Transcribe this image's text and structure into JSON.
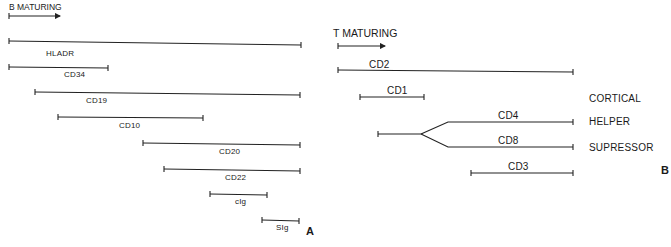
{
  "panel_a": {
    "letter": "A",
    "title": "B MATURING",
    "markers": [
      {
        "name": "HLADR",
        "label": "HLADR"
      },
      {
        "name": "CD34",
        "label": "CD34"
      },
      {
        "name": "CD19",
        "label": "CD19"
      },
      {
        "name": "CD10",
        "label": "CD10"
      },
      {
        "name": "CD20",
        "label": "CD20"
      },
      {
        "name": "CD22",
        "label": "CD22"
      },
      {
        "name": "cIg",
        "label": "cIg"
      },
      {
        "name": "SIg",
        "label": "SIg"
      }
    ]
  },
  "panel_b": {
    "letter": "B",
    "title": "T MATURING",
    "markers": [
      {
        "name": "CD2",
        "label": "CD2"
      },
      {
        "name": "CD1",
        "label": "CD1"
      },
      {
        "name": "CD4",
        "label": "CD4"
      },
      {
        "name": "CD8",
        "label": "CD8"
      },
      {
        "name": "CD3",
        "label": "CD3"
      }
    ],
    "stages": [
      {
        "name": "cortical",
        "label": "CORTICAL"
      },
      {
        "name": "helper",
        "label": "HELPER"
      },
      {
        "name": "supressor",
        "label": "SUPRESSOR"
      }
    ]
  },
  "colors": {
    "line": "#222222",
    "text": "#1a1a1a",
    "background": "#ffffff"
  }
}
